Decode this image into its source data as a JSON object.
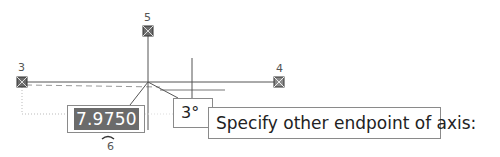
{
  "grips": [
    {
      "label": "3",
      "x": 22,
      "y": 82
    },
    {
      "label": "4",
      "x": 279,
      "y": 82
    },
    {
      "label": "5",
      "x": 148,
      "y": 31
    }
  ],
  "cursor_label": "6",
  "dynamic_input": {
    "value": "7.9750"
  },
  "angle_tooltip": {
    "value": "3°"
  },
  "command_prompt": {
    "text": "Specify other endpoint of axis:"
  },
  "colors": {
    "line": "#555555",
    "grip_fill": "#6b6b6b",
    "input_highlight": "#6b6b6b",
    "tooltip_border": "#8a8a8a"
  }
}
